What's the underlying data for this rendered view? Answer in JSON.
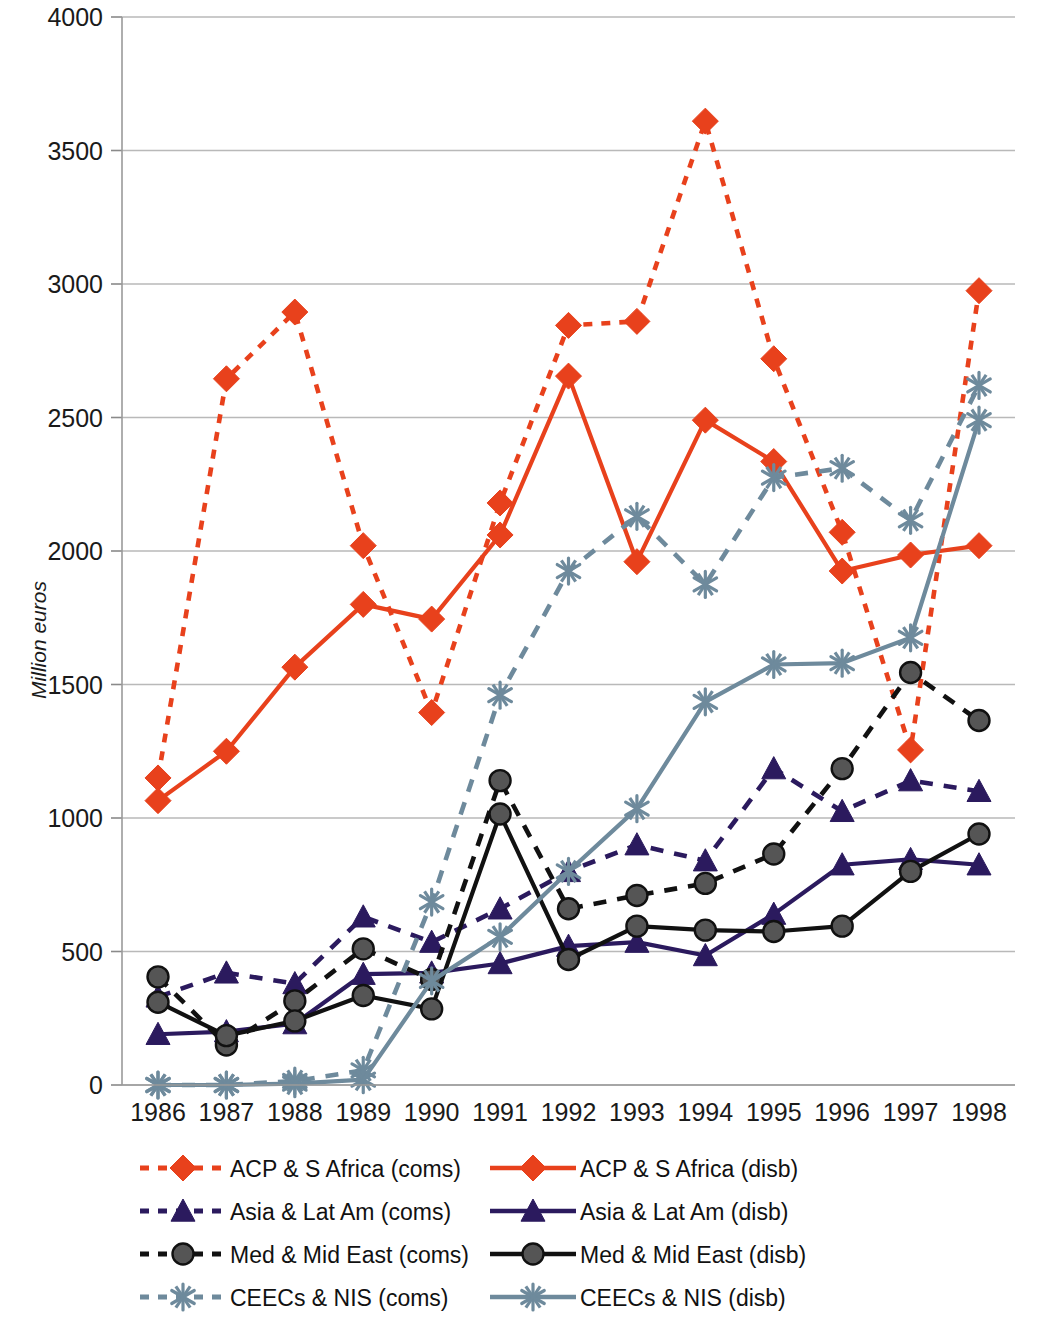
{
  "chart_data": {
    "type": "line",
    "title": "",
    "xlabel": "",
    "ylabel": "Million euros",
    "x": [
      1986,
      1987,
      1988,
      1989,
      1990,
      1991,
      1992,
      1993,
      1994,
      1995,
      1996,
      1997,
      1998
    ],
    "categories": [
      "1986",
      "1987",
      "1988",
      "1989",
      "1990",
      "1991",
      "1992",
      "1993",
      "1994",
      "1995",
      "1996",
      "1997",
      "1998"
    ],
    "ylim": [
      0,
      4000
    ],
    "ytick_values": [
      0,
      500,
      1000,
      1500,
      2000,
      2500,
      3000,
      3500,
      4000
    ],
    "ytick_labels": [
      "0",
      "500",
      "1000",
      "1500",
      "2000",
      "2500",
      "3000",
      "3500",
      "4000"
    ],
    "grid": true,
    "legend_position": "bottom",
    "series": [
      {
        "name": "ACP & S Africa (coms)",
        "key": "acp_coms",
        "color": "#E8411C",
        "marker": "diamond",
        "line": "dashed",
        "values": [
          1150,
          2645,
          2895,
          2020,
          1395,
          2180,
          2845,
          2860,
          3610,
          2720,
          2070,
          1255,
          2975
        ]
      },
      {
        "name": "ACP & S Africa (disb)",
        "key": "acp_disb",
        "color": "#E8411C",
        "marker": "diamond",
        "line": "solid",
        "values": [
          1065,
          1250,
          1565,
          1800,
          1745,
          2060,
          2655,
          1960,
          2490,
          2335,
          1925,
          1985,
          2020
        ]
      },
      {
        "name": "Asia & Lat Am (coms)",
        "key": "asia_coms",
        "color": "#2B1A5E",
        "marker": "triangle",
        "line": "dashed",
        "values": [
          330,
          420,
          380,
          630,
          535,
          660,
          800,
          900,
          840,
          1185,
          1025,
          1140,
          1100
        ]
      },
      {
        "name": "Asia & Lat Am (disb)",
        "key": "asia_disb",
        "color": "#2B1A5E",
        "marker": "triangle",
        "line": "solid",
        "values": [
          190,
          200,
          230,
          415,
          420,
          455,
          520,
          535,
          485,
          640,
          825,
          845,
          825
        ]
      },
      {
        "name": "Med & Mid East (coms)",
        "key": "med_coms",
        "color": "#111111",
        "marker": "circle",
        "line": "dashed",
        "values": [
          405,
          150,
          315,
          510,
          395,
          1140,
          660,
          710,
          755,
          865,
          1185,
          1545,
          1365
        ]
      },
      {
        "name": "Med & Mid East (disb)",
        "key": "med_disb",
        "color": "#111111",
        "marker": "circle",
        "line": "solid",
        "values": [
          310,
          185,
          240,
          335,
          285,
          1015,
          470,
          595,
          580,
          575,
          595,
          800,
          940
        ]
      },
      {
        "name": "CEECs & NIS (coms)",
        "key": "ceec_coms",
        "color": "#6E8A9C",
        "marker": "asterisk",
        "line": "dashed",
        "values": [
          0,
          0,
          15,
          55,
          685,
          1460,
          1925,
          2130,
          1875,
          2275,
          2310,
          2115,
          2620
        ]
      },
      {
        "name": "CEECs & NIS (disb)",
        "key": "ceec_disb",
        "color": "#6E8A9C",
        "marker": "asterisk",
        "line": "solid",
        "values": [
          0,
          0,
          5,
          20,
          390,
          555,
          800,
          1035,
          1435,
          1575,
          1580,
          1675,
          2490
        ]
      }
    ]
  },
  "legend": {
    "items": [
      {
        "label": "ACP & S Africa (coms)",
        "key": "acp_coms"
      },
      {
        "label": "ACP & S Africa (disb)",
        "key": "acp_disb"
      },
      {
        "label": "Asia & Lat Am (coms)",
        "key": "asia_coms"
      },
      {
        "label": "Asia & Lat Am (disb)",
        "key": "asia_disb"
      },
      {
        "label": "Med & Mid East (coms)",
        "key": "med_coms"
      },
      {
        "label": "Med & Mid East (disb)",
        "key": "med_disb"
      },
      {
        "label": "CEECs & NIS (coms)",
        "key": "ceec_coms"
      },
      {
        "label": "CEECs & NIS (disb)",
        "key": "ceec_disb"
      }
    ]
  }
}
